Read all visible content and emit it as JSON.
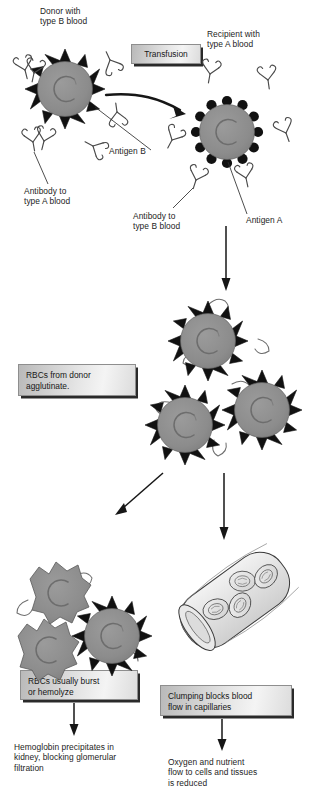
{
  "figure": {
    "background_color": "#ffffff",
    "cell_body_color": "#8c8c8c",
    "antigen_color": "#111111",
    "antibody_color": "#4a4a4a",
    "box_text_color": "#171717"
  },
  "labels": {
    "donor": "Donor with\ntype B blood",
    "recipient": "Recipient with\ntype A blood",
    "antigen_b": "Antigen B",
    "antibody_to_a": "Antibody to\ntype A blood",
    "antibody_to_b": "Antibody to\ntype B blood",
    "antigen_a": "Antigen A"
  },
  "boxes": {
    "transfusion": "Transfusion",
    "agglutinate": "RBCs from donor\nagglutinate.",
    "hemolyze": "RBCs usually burst\nor hemolyze",
    "clumping": "Clumping blocks blood\nflow in capillaries"
  },
  "outcomes": {
    "kidney": "Hemoglobin precipitates in\nkidney, blocking glomerular\nfiltration",
    "oxygen": "Oxygen and nutrient\nflow to cells and tissues\nis reduced"
  },
  "icons": {
    "donor_cell": "spiked-red-blood-cell-icon",
    "recipient_cell": "knobbed-red-blood-cell-icon",
    "antibody": "antibody-y-icon",
    "capillary": "capillary-tube-icon",
    "burst_cell": "hemolyzed-red-blood-cell-icon",
    "arrow": "arrow-icon"
  }
}
